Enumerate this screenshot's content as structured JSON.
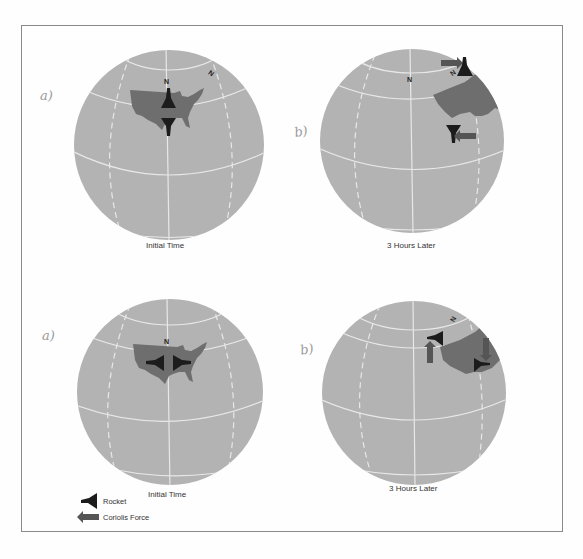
{
  "figure": {
    "colors": {
      "background": "#fefefe",
      "globe": "#b3b3b3",
      "grid_lines": "#e8e8e8",
      "usa": "#6e6e6e",
      "rocket": "#1c1c1c",
      "coriolis_arrow": "#555555",
      "frame": "#8a8a8a"
    },
    "panels": [
      {
        "id": "top-left",
        "hand_label": "a)",
        "north_label": "N",
        "north_label_2": "N",
        "caption": "Initial Time"
      },
      {
        "id": "top-right",
        "hand_label": "b)",
        "north_label": "N",
        "north_label_2": "N",
        "caption": "3 Hours Later"
      },
      {
        "id": "bottom-left",
        "hand_label": "a)",
        "north_label": "N",
        "caption": "Initial Time"
      },
      {
        "id": "bottom-right",
        "hand_label": "b)",
        "north_label": "N",
        "caption": "3 Hours Later"
      }
    ],
    "legend": {
      "rocket_label": "Rocket",
      "coriolis_label": "Coriolis Force"
    }
  }
}
